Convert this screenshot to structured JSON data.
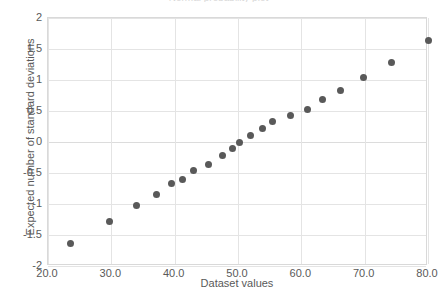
{
  "chart_data": {
    "type": "scatter",
    "title": "Normal probability plot",
    "xlabel": "Dataset values",
    "ylabel": "Expected number of standard deviations",
    "xlim": [
      20,
      80
    ],
    "ylim": [
      -2,
      2
    ],
    "grid": true,
    "legend": "none",
    "marker_color": "#595959",
    "xticks": [
      "20.0",
      "30.0",
      "40.0",
      "50.0",
      "60.0",
      "70.0",
      "80.0"
    ],
    "xtick_values": [
      20,
      30,
      40,
      50,
      60,
      70,
      80
    ],
    "yticks": [
      "2",
      "1.5",
      "1",
      "0.5",
      "0",
      "-0.5",
      "-1",
      "-1.5",
      "-2"
    ],
    "ytick_values": [
      2,
      1.5,
      1,
      0.5,
      0,
      -0.5,
      -1,
      -1.5,
      -2
    ],
    "series": [
      {
        "name": "Expected normal order statistics",
        "points": [
          {
            "x": 23.5,
            "y": -1.64
          },
          {
            "x": 29.7,
            "y": -1.28
          },
          {
            "x": 34.0,
            "y": -1.03
          },
          {
            "x": 37.2,
            "y": -0.85
          },
          {
            "x": 39.5,
            "y": -0.67
          },
          {
            "x": 41.3,
            "y": -0.6
          },
          {
            "x": 43.0,
            "y": -0.46
          },
          {
            "x": 45.3,
            "y": -0.36
          },
          {
            "x": 47.6,
            "y": -0.22
          },
          {
            "x": 49.2,
            "y": -0.1
          },
          {
            "x": 50.3,
            "y": 0.0
          },
          {
            "x": 51.9,
            "y": 0.11
          },
          {
            "x": 53.8,
            "y": 0.22
          },
          {
            "x": 55.5,
            "y": 0.33
          },
          {
            "x": 58.3,
            "y": 0.42
          },
          {
            "x": 60.9,
            "y": 0.52
          },
          {
            "x": 63.4,
            "y": 0.68
          },
          {
            "x": 66.2,
            "y": 0.83
          },
          {
            "x": 69.8,
            "y": 1.04
          },
          {
            "x": 74.2,
            "y": 1.28
          },
          {
            "x": 80.0,
            "y": 1.64
          }
        ]
      }
    ]
  }
}
